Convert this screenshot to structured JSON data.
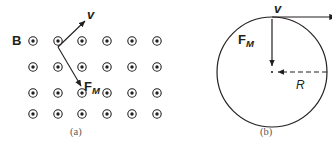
{
  "figure": {
    "width": 332,
    "height": 144,
    "background": "#ffffff",
    "ink_color": "#231f20",
    "caption_color": "#5a5a5a"
  },
  "panel_a": {
    "caption": "(a)",
    "field_label": "B",
    "field_symbol": "field-out-of-page-dot",
    "field_description": "uniform magnetic field out of the page",
    "velocity_label": "v",
    "force_label_base": "F",
    "force_label_sub": "M",
    "grid": {
      "rows": 4,
      "cols": 6,
      "x_positions": [
        33,
        58,
        82,
        107,
        132,
        157
      ],
      "y_positions": [
        41,
        67,
        93,
        113
      ],
      "outer_radius": 4.2,
      "inner_radius": 1.7
    },
    "vectors": [
      {
        "name": "velocity",
        "label": "v",
        "x1": 58,
        "y1": 47,
        "x2": 86,
        "y2": 20
      },
      {
        "name": "magnetic-force",
        "label": "F_M",
        "x1": 58,
        "y1": 47,
        "x2": 82,
        "y2": 88
      }
    ]
  },
  "panel_b": {
    "caption": "(b)",
    "velocity_label": "v",
    "force_label_base": "F",
    "force_label_sub": "M",
    "radius_label": "R",
    "circle": {
      "cx": 106,
      "cy": 72,
      "r": 55,
      "description": "circular path of charged particle"
    },
    "vectors": [
      {
        "name": "velocity",
        "label": "v",
        "x1": 106,
        "y1": 17,
        "x2": 172,
        "y2": 17
      },
      {
        "name": "magnetic-force",
        "label": "F_M",
        "x1": 106,
        "y1": 19,
        "x2": 106,
        "y2": 68
      },
      {
        "name": "radius",
        "label": "R",
        "x1": 161,
        "y1": 72,
        "x2": 110,
        "y2": 72,
        "style": "dashed"
      }
    ]
  }
}
